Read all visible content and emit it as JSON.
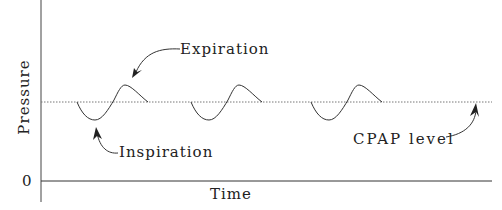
{
  "diagram": {
    "y_axis_label": "Pressure",
    "x_axis_label": "Time",
    "y_zero_tick": "0",
    "annotations": {
      "expiration": "Expiration",
      "inspiration": "Inspiration",
      "cpap_level": "CPAP level"
    },
    "cycles": 3,
    "colors": {
      "line": "#333333",
      "dotted": "#777777"
    }
  }
}
